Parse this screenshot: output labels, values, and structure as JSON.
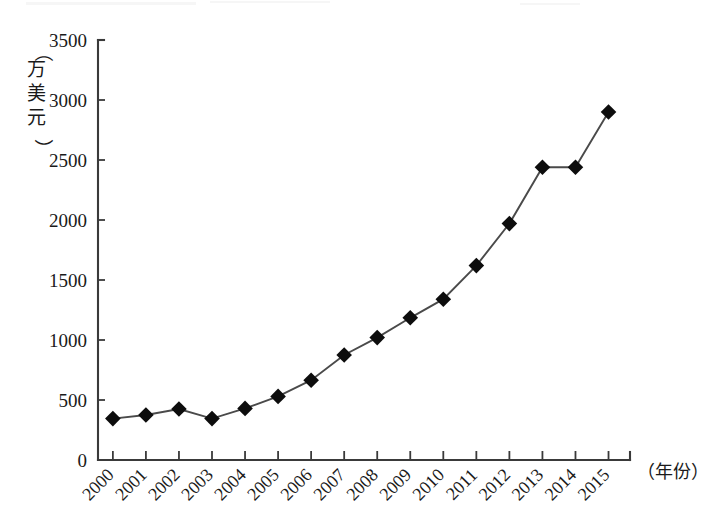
{
  "chart_data": {
    "type": "line",
    "title": "",
    "subtitle": "",
    "xlabel": "（年份）",
    "ylabel": "（万美元）",
    "categories": [
      "2000",
      "2001",
      "2002",
      "2003",
      "2004",
      "2005",
      "2006",
      "2007",
      "2008",
      "2009",
      "2010",
      "2011",
      "2012",
      "2013",
      "2014",
      "2015"
    ],
    "values": [
      345,
      375,
      425,
      345,
      430,
      530,
      665,
      875,
      1020,
      1185,
      1340,
      1620,
      1970,
      2440,
      2440,
      2900
    ],
    "series": [
      {
        "name": "",
        "values": [
          345,
          375,
          425,
          345,
          430,
          530,
          665,
          875,
          1020,
          1185,
          1340,
          1620,
          1970,
          2440,
          2440,
          2900
        ]
      }
    ],
    "ylim": [
      0,
      3500
    ],
    "ytick_labels": [
      "0",
      "500",
      "1000",
      "1500",
      "2000",
      "2500",
      "3000",
      "3500"
    ],
    "ytick_values": [
      0,
      500,
      1000,
      1500,
      2000,
      2500,
      3000,
      3500
    ],
    "xtick_labels": [
      "2000",
      "2001",
      "2002",
      "2003",
      "2004",
      "2005",
      "2006",
      "2007",
      "2008",
      "2009",
      "2010",
      "2011",
      "2012",
      "2013",
      "2014",
      "2015"
    ],
    "xtick_rotation": -45,
    "grid": false,
    "legend": false,
    "legend_position": "none",
    "marker": "diamond",
    "marker_color": "#0d0d0d",
    "line_color": "#4a4a4a",
    "axis_color": "#3a3a3a",
    "background_color": "#ffffff",
    "annotations": []
  },
  "axis": {
    "y_unit_label": "（万美元）",
    "y_unit_chars": [
      "（",
      "万",
      "美",
      "元",
      "）"
    ],
    "x_unit_label": "（年份）"
  }
}
